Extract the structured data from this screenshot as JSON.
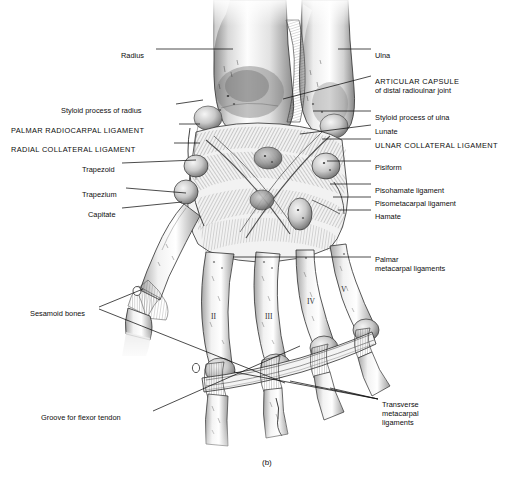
{
  "figure": {
    "caption": "(b)",
    "line_color": "#101010",
    "text_color": "#0d0d0d",
    "background": "#ffffff"
  },
  "labels_left": [
    {
      "id": "radius",
      "text": "Radius",
      "x": 121,
      "y": 51,
      "anchor_x": 233,
      "anchor_y": 51,
      "caps": false
    },
    {
      "id": "styloid-process-of-radius",
      "text": "Styloid process of radius",
      "x": 61,
      "y": 106,
      "anchor_x": 203,
      "anchor_y": 103,
      "caps": false
    },
    {
      "id": "palmar-radiocarpal-ligament",
      "text": "PALMAR RADIOCARPAL LIGAMENT",
      "x": 11,
      "y": 126,
      "anchor_x": 200,
      "anchor_y": 126,
      "caps": true
    },
    {
      "id": "radial-collateral-ligament",
      "text": "RADIAL COLLATERAL LIGAMENT",
      "x": 11,
      "y": 145,
      "anchor_x": 200,
      "anchor_y": 145,
      "caps": true
    },
    {
      "id": "trapezoid",
      "text": "Trapezoid",
      "x": 82,
      "y": 165,
      "anchor_x": 196,
      "anchor_y": 163,
      "caps": false
    },
    {
      "id": "trapezium",
      "text": "Trapezium",
      "x": 82,
      "y": 190,
      "anchor_x": 186,
      "anchor_y": 194,
      "caps": false
    },
    {
      "id": "capitate",
      "text": "Capitate",
      "x": 88,
      "y": 210,
      "anchor_x": 182,
      "anchor_y": 205,
      "caps": false
    },
    {
      "id": "sesamoid-bones",
      "text": "Sesamoid bones",
      "x": 30,
      "y": 309,
      "anchor_x": 136,
      "anchor_y": 292,
      "caps": false
    },
    {
      "id": "groove-for-flexor-tendon",
      "text": "Groove for flexor tendon",
      "x": 41,
      "y": 413,
      "anchor_x": 196,
      "anchor_y": 366,
      "caps": false
    }
  ],
  "labels_right": [
    {
      "id": "ulna",
      "text": "Ulna",
      "x": 375,
      "y": 51,
      "anchor_x": 300,
      "anchor_y": 51,
      "caps": false
    },
    {
      "id": "articular-capsule",
      "text": "ARTICULAR CAPSULE",
      "sub": "of distal radioulnar joint",
      "x": 375,
      "y": 77,
      "anchor_x": 282,
      "anchor_y": 99,
      "caps": true
    },
    {
      "id": "styloid-process-of-ulna",
      "text": "Styloid process of ulna",
      "x": 375,
      "y": 113,
      "anchor_x": 313,
      "anchor_y": 113,
      "caps": false
    },
    {
      "id": "lunate",
      "text": "Lunate",
      "x": 375,
      "y": 127,
      "anchor_x": 300,
      "anchor_y": 136,
      "caps": false
    },
    {
      "id": "ulnar-collateral-ligament",
      "text": "ULNAR COLLATERAL LIGAMENT",
      "x": 375,
      "y": 141,
      "anchor_x": 322,
      "anchor_y": 141,
      "caps": true
    },
    {
      "id": "pisiform",
      "text": "Pisiform",
      "x": 375,
      "y": 163,
      "anchor_x": 327,
      "anchor_y": 163,
      "caps": false
    },
    {
      "id": "pisohamate-ligament",
      "text": "Pisohamate ligament",
      "x": 375,
      "y": 186,
      "anchor_x": 330,
      "anchor_y": 186,
      "caps": false
    },
    {
      "id": "pisometacarpal-ligament",
      "text": "Pisometacarpal ligament",
      "x": 375,
      "y": 199,
      "anchor_x": 333,
      "anchor_y": 199,
      "caps": false
    },
    {
      "id": "hamate",
      "text": "Hamate",
      "x": 375,
      "y": 212,
      "anchor_x": 338,
      "anchor_y": 212,
      "caps": false
    },
    {
      "id": "palmar-metacarpal-ligaments",
      "text": "Palmar",
      "sub": "metacarpal ligaments",
      "x": 375,
      "y": 255,
      "anchor_x": 233,
      "anchor_y": 259,
      "caps": false
    },
    {
      "id": "transverse-metacarpal-ligaments",
      "text": "Transverse",
      "sub": "metacarpal",
      "sub2": "ligaments",
      "x": 382,
      "y": 400,
      "anchor_x": 298,
      "anchor_y": 380,
      "caps": false
    }
  ],
  "metacarpal_numerals": [
    {
      "id": "metacarpal-ii",
      "text": "II",
      "x": 211,
      "y": 312
    },
    {
      "id": "metacarpal-iii",
      "text": "III",
      "x": 265,
      "y": 312
    },
    {
      "id": "metacarpal-iv",
      "text": "IV",
      "x": 307,
      "y": 297
    },
    {
      "id": "metacarpal-v",
      "text": "V",
      "x": 341,
      "y": 285
    }
  ],
  "anatomy_structures": [
    "radius shaft",
    "ulna shaft",
    "distal radioulnar joint capsule",
    "radial styloid process",
    "ulnar styloid process",
    "lunate",
    "pisiform",
    "hamate",
    "capitate",
    "trapezium",
    "trapezoid",
    "palmar radiocarpal ligament",
    "radial collateral ligament",
    "ulnar collateral ligament",
    "pisohamate ligament",
    "pisometacarpal ligament",
    "palmar metacarpal ligaments",
    "transverse metacarpal ligaments",
    "metacarpals I-V",
    "proximal phalanges",
    "sesamoid bones",
    "groove for flexor tendon"
  ]
}
